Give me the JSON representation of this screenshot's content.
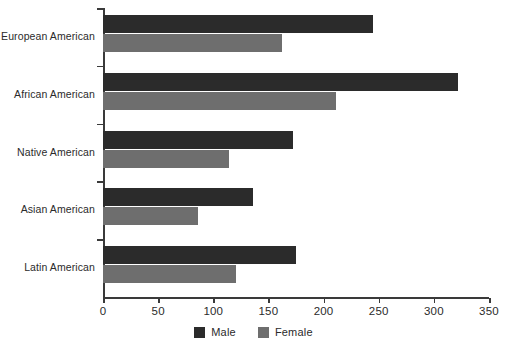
{
  "chart_data": {
    "type": "bar",
    "orientation": "horizontal",
    "title": "",
    "xlabel": "",
    "ylabel": "",
    "categories": [
      "European American",
      "African American",
      "Native American",
      "Asian American",
      "Latin American"
    ],
    "series": [
      {
        "name": "Male",
        "color": "#2b2b2b",
        "values": [
          245,
          322,
          172,
          136,
          175
        ]
      },
      {
        "name": "Female",
        "color": "#6e6e6e",
        "values": [
          162,
          211,
          114,
          86,
          121
        ]
      }
    ],
    "xlim": [
      0,
      350
    ],
    "xticks": [
      0,
      50,
      100,
      150,
      200,
      250,
      300,
      350
    ],
    "xtick_labels": [
      "0",
      "50",
      "100",
      "150",
      "200",
      "250",
      "300",
      "350"
    ],
    "grid": false,
    "legend_position": "bottom-center",
    "legend_entries": [
      "Male",
      "Female"
    ]
  },
  "legend": {
    "male_label": "Male",
    "female_label": "Female"
  },
  "colors": {
    "male": "#2b2b2b",
    "female": "#6e6e6e",
    "axis": "#3a3a3a",
    "background": "#ffffff",
    "text": "#2b2b2b"
  }
}
